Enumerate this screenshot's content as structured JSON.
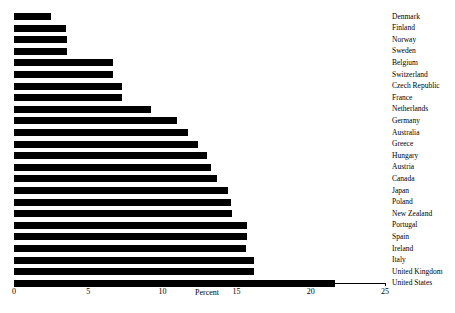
{
  "chart_data": {
    "type": "bar",
    "orientation": "horizontal",
    "title": "",
    "xlabel": "Percent",
    "ylabel": "",
    "xlim": [
      0,
      25
    ],
    "xticks": [
      0,
      5,
      10,
      15,
      20,
      25
    ],
    "grid": false,
    "legend": false,
    "bar_color": "#000000",
    "categories": [
      "Denmark",
      "Finland",
      "Norway",
      "Sweden",
      "Belgium",
      "Switzerland",
      "Czech Republic",
      "France",
      "Netherlands",
      "Germany",
      "Australia",
      "Greece",
      "Hungary",
      "Austria",
      "Canada",
      "Japan",
      "Poland",
      "New Zealand",
      "Portugal",
      "Spain",
      "Ireland",
      "Italy",
      "United Kingdom",
      "United States"
    ],
    "values": [
      2.5,
      3.5,
      3.6,
      3.6,
      6.7,
      6.7,
      7.3,
      7.3,
      9.2,
      11.0,
      11.7,
      12.4,
      13.0,
      13.3,
      13.7,
      14.4,
      14.6,
      14.7,
      15.7,
      15.7,
      15.6,
      16.2,
      16.2,
      21.6
    ]
  }
}
